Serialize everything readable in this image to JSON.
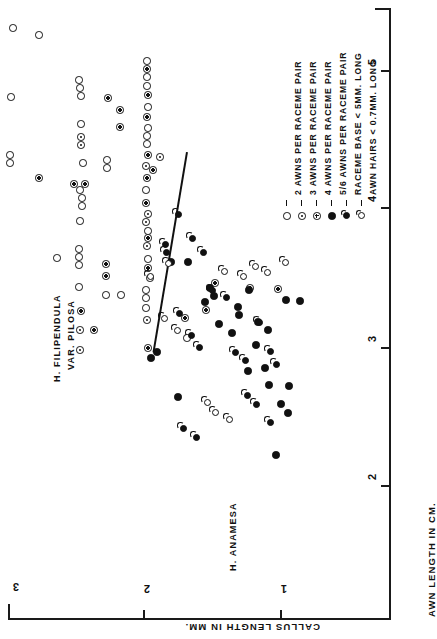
{
  "figure": {
    "orientation": "rotated-90",
    "group_labels": [
      {
        "text": "H. FILIPENDULA",
        "x": 52,
        "y": 345
      },
      {
        "text": "VAR. PILOSA",
        "x": 66,
        "y": 338
      },
      {
        "text": "H. ANAMESA",
        "x": 228,
        "y": 545
      }
    ]
  },
  "axes": {
    "x_title": "CALLUS  LENGTH  IN  MM.",
    "y_title": "AWN  LENGTH  IN  CM.",
    "x_ticks": [
      "3",
      "2",
      "1"
    ],
    "y_ticks": [
      "5",
      "4",
      "3",
      "2"
    ]
  },
  "legend": {
    "entries": [
      {
        "marker": "open-circle",
        "dash": "—",
        "label": "2 AWNS  PER  RACEME  PAIR"
      },
      {
        "marker": "dotted-circle",
        "dash": "—",
        "label": "3 AWNS  PER  RACEME  PAIR"
      },
      {
        "marker": "crossed-circle",
        "dash": "—",
        "label": "4 AWNS  PER  RACEME  PAIR"
      },
      {
        "marker": "filled-circle",
        "dash": "—",
        "label": "5/6 AWNS  PER  RACEME  PAIR"
      },
      {
        "marker": "tail-circle",
        "dash": "—",
        "label": "RACEME  BASE < 5MM. LONG"
      },
      {
        "marker": "tail-open",
        "dash": "—",
        "label": "AWN HAIRS < 0.7MM. LONG"
      }
    ]
  },
  "chart_data": {
    "type": "scatter",
    "title": "",
    "xlabel": "CALLUS LENGTH IN MM.",
    "ylabel": "AWN LENGTH IN CM.",
    "xlim": [
      3.1,
      0.55
    ],
    "ylim": [
      5.5,
      1.7
    ],
    "grid": false,
    "legend_position": "upper-right",
    "note": "Plot is printed rotated 90 degrees; callus length runs left-to-right decreasing 3->1, awn length runs top-to-bottom decreasing 5->2.",
    "axis_pixel_calibration": {
      "x": [
        {
          "value": 3,
          "px": 14
        },
        {
          "value": 2,
          "px": 143
        },
        {
          "value": 1,
          "px": 280
        }
      ],
      "y": [
        {
          "value": 5,
          "px": 70
        },
        {
          "value": 4,
          "px": 207
        },
        {
          "value": 3,
          "px": 347
        },
        {
          "value": 2,
          "px": 485
        }
      ]
    },
    "separator_line": {
      "x1": 186,
      "y1": 152,
      "x2": 152,
      "y2": 352
    },
    "series": [
      {
        "name": "2 AWNS PER RACEME PAIR",
        "marker": "open-circle",
        "group": "H. FILIPENDULA VAR. PILOSA",
        "points_px": [
          [
            13,
            28
          ],
          [
            39,
            35
          ],
          [
            11,
            97
          ],
          [
            10,
            155
          ],
          [
            10,
            163
          ],
          [
            79,
            80
          ],
          [
            80,
            88
          ],
          [
            81,
            96
          ],
          [
            81,
            124
          ],
          [
            83,
            163
          ],
          [
            80,
            190
          ],
          [
            82,
            198
          ],
          [
            82,
            206
          ],
          [
            80,
            221
          ],
          [
            79,
            249
          ],
          [
            79,
            257
          ],
          [
            79,
            265
          ],
          [
            107,
            160
          ],
          [
            107,
            168
          ],
          [
            147,
            61
          ],
          [
            147,
            77
          ],
          [
            147,
            86
          ],
          [
            148,
            107
          ],
          [
            148,
            128
          ],
          [
            147,
            136
          ],
          [
            147,
            144
          ],
          [
            146,
            190
          ],
          [
            148,
            231
          ],
          [
            148,
            259
          ],
          [
            146,
            290
          ],
          [
            146,
            298
          ],
          [
            79,
            287
          ],
          [
            106,
            295
          ],
          [
            121,
            295
          ],
          [
            146,
            308
          ],
          [
            150,
            278
          ],
          [
            187,
            338
          ],
          [
            57,
            258
          ]
        ]
      },
      {
        "name": "3 AWNS PER RACEME PAIR",
        "marker": "dotted-circle",
        "group": "H. FILIPENDULA VAR. PILOSA",
        "points_px": [
          [
            81,
            137
          ],
          [
            81,
            145
          ],
          [
            160,
            157
          ],
          [
            148,
            214
          ],
          [
            146,
            222
          ],
          [
            147,
            246
          ],
          [
            80,
            330
          ],
          [
            80,
            350
          ],
          [
            147,
            320
          ],
          [
            146,
            166
          ]
        ]
      },
      {
        "name": "4 AWNS PER RACEME PAIR",
        "marker": "crossed-circle",
        "group": "H. FILIPENDULA VAR. PILOSA",
        "points_px": [
          [
            108,
            98
          ],
          [
            120,
            110
          ],
          [
            120,
            127
          ],
          [
            39,
            178
          ],
          [
            74,
            184
          ],
          [
            85,
            184
          ],
          [
            147,
            69
          ],
          [
            148,
            95
          ],
          [
            147,
            117
          ],
          [
            148,
            155
          ],
          [
            147,
            178
          ],
          [
            153,
            170
          ],
          [
            146,
            203
          ],
          [
            148,
            238
          ],
          [
            148,
            268
          ],
          [
            106,
            264
          ],
          [
            106,
            276
          ],
          [
            94,
            330
          ],
          [
            81,
            311
          ],
          [
            148,
            348
          ],
          [
            185,
            318
          ],
          [
            206,
            310
          ],
          [
            215,
            283
          ],
          [
            250,
            288
          ],
          [
            278,
            289
          ]
        ]
      },
      {
        "name": "5/6 AWNS PER RACEME PAIR",
        "marker": "filled-circle",
        "group": "H. ANAMESA",
        "points_px": [
          [
            171,
            262
          ],
          [
            188,
            262
          ],
          [
            210,
            288
          ],
          [
            249,
            290
          ],
          [
            238,
            307
          ],
          [
            219,
            324
          ],
          [
            232,
            333
          ],
          [
            256,
            345
          ],
          [
            248,
            371
          ],
          [
            265,
            368
          ],
          [
            269,
            385
          ],
          [
            289,
            386
          ],
          [
            276,
            455
          ],
          [
            157,
            352
          ],
          [
            151,
            358
          ],
          [
            178,
            397
          ],
          [
            205,
            302
          ],
          [
            214,
            296
          ],
          [
            286,
            300
          ],
          [
            300,
            301
          ],
          [
            239,
            315
          ],
          [
            258,
            322
          ],
          [
            268,
            330
          ],
          [
            281,
            404
          ],
          [
            288,
            413
          ]
        ]
      },
      {
        "name": "RACEME BASE < 5MM. LONG",
        "marker": "tail-circle",
        "group": "mixed",
        "points_px": [
          [
            165,
            244
          ],
          [
            166,
            252
          ],
          [
            178,
            214
          ],
          [
            192,
            238
          ],
          [
            203,
            252
          ],
          [
            179,
            313
          ],
          [
            191,
            335
          ],
          [
            199,
            347
          ],
          [
            212,
            290
          ],
          [
            226,
            297
          ],
          [
            235,
            352
          ],
          [
            245,
            360
          ],
          [
            259,
            322
          ],
          [
            270,
            351
          ],
          [
            276,
            364
          ],
          [
            247,
            395
          ],
          [
            256,
            404
          ],
          [
            183,
            428
          ],
          [
            196,
            437
          ],
          [
            270,
            422
          ]
        ]
      },
      {
        "name": "AWN HAIRS < 0.7MM. LONG",
        "marker": "tail-open",
        "group": "mixed",
        "points_px": [
          [
            168,
            263
          ],
          [
            150,
            276
          ],
          [
            164,
            318
          ],
          [
            177,
            330
          ],
          [
            224,
            271
          ],
          [
            243,
            276
          ],
          [
            255,
            266
          ],
          [
            267,
            272
          ],
          [
            285,
            262
          ],
          [
            207,
            402
          ],
          [
            215,
            412
          ],
          [
            229,
            419
          ]
        ]
      }
    ]
  }
}
